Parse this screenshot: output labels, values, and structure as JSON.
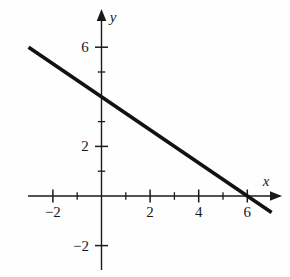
{
  "figure": {
    "title": "",
    "background_color": "#fefefe",
    "ink_color": "#1a1a1a",
    "width": 290,
    "height": 277
  },
  "axes": {
    "x_name": "x",
    "y_name": "y",
    "x_name_pos": {
      "x": 266,
      "y": 181
    },
    "y_name_pos": {
      "x": 113,
      "y": 17
    }
  },
  "chart_data": {
    "type": "line",
    "title": "",
    "xlabel": "x",
    "ylabel": "y",
    "grid": false,
    "legend": null,
    "xlim": [
      -3.05,
      7.4
    ],
    "ylim": [
      -3.0,
      7.5
    ],
    "origin_px": {
      "x": 101.5,
      "y": 196
    },
    "unit_px": {
      "x": 24.3,
      "y": 24.8
    },
    "x_ticks_major": [
      -2,
      2,
      4,
      6
    ],
    "x_ticks_minor": [
      -1,
      1,
      3,
      5
    ],
    "y_ticks_major": [
      -2,
      2,
      6
    ],
    "y_ticks_minor": [
      1,
      3,
      5
    ],
    "x_tick_labels": [
      {
        "value": -2,
        "text": "−2"
      },
      {
        "value": 2,
        "text": "2"
      },
      {
        "value": 4,
        "text": "4"
      },
      {
        "value": 6,
        "text": "6"
      }
    ],
    "y_tick_labels": [
      {
        "value": 6,
        "text": "6"
      },
      {
        "value": 2,
        "text": "2"
      },
      {
        "value": -2,
        "text": "−2"
      }
    ],
    "series": [
      {
        "name": "line",
        "equation": "y = -2/3 x + 4",
        "slope": -0.6667,
        "intercept": 4,
        "x_intercept": 6,
        "y_intercept": 4,
        "x": [
          -3,
          7
        ],
        "values": [
          6,
          -0.6667
        ],
        "color": "#111111",
        "width_px": 3.6
      }
    ],
    "annotations": []
  }
}
